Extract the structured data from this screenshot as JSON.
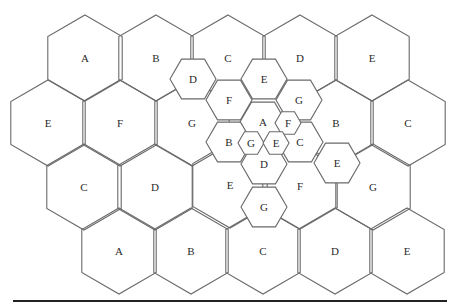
{
  "diagram": {
    "type": "hexagonal-cell-reuse",
    "colors": {
      "stroke": "#6a6a6a",
      "text": "#2a2a2a",
      "rule": "#222222",
      "background": "#ffffff"
    },
    "large_cells": [
      {
        "label": "A",
        "cx": 85,
        "cy": 58
      },
      {
        "label": "B",
        "cx": 156,
        "cy": 58
      },
      {
        "label": "C",
        "cx": 228,
        "cy": 58
      },
      {
        "label": "D",
        "cx": 300,
        "cy": 58
      },
      {
        "label": "E",
        "cx": 372,
        "cy": 58
      },
      {
        "label": "E",
        "cx": 48,
        "cy": 123
      },
      {
        "label": "F",
        "cx": 120,
        "cy": 123
      },
      {
        "label": "G",
        "cx": 192,
        "cy": 123
      },
      {
        "label": "B",
        "cx": 336,
        "cy": 123
      },
      {
        "label": "C",
        "cx": 408,
        "cy": 123
      },
      {
        "label": "C",
        "cx": 84,
        "cy": 187
      },
      {
        "label": "D",
        "cx": 155,
        "cy": 187
      },
      {
        "label": "E",
        "cx": 230,
        "cy": 185
      },
      {
        "label": "F",
        "cx": 300,
        "cy": 186
      },
      {
        "label": "G",
        "cx": 373,
        "cy": 187
      },
      {
        "label": "A",
        "cx": 119,
        "cy": 251
      },
      {
        "label": "B",
        "cx": 191,
        "cy": 251
      },
      {
        "label": "C",
        "cx": 263,
        "cy": 251
      },
      {
        "label": "D",
        "cx": 335,
        "cy": 251
      },
      {
        "label": "E",
        "cx": 407,
        "cy": 251
      }
    ],
    "medium_cells": [
      {
        "label": "D",
        "cx": 193,
        "cy": 79
      },
      {
        "label": "E",
        "cx": 264,
        "cy": 79
      },
      {
        "label": "F",
        "cx": 229,
        "cy": 100
      },
      {
        "label": "G",
        "cx": 299,
        "cy": 100
      },
      {
        "label": "A",
        "cx": 263,
        "cy": 122
      },
      {
        "label": "B",
        "cx": 229,
        "cy": 142
      },
      {
        "label": "C",
        "cx": 300,
        "cy": 142
      },
      {
        "label": "D",
        "cx": 264,
        "cy": 164
      },
      {
        "label": "E",
        "cx": 337,
        "cy": 163
      },
      {
        "label": "G",
        "cx": 264,
        "cy": 207
      }
    ],
    "small_cells": [
      {
        "label": "F",
        "cx": 288,
        "cy": 123
      },
      {
        "label": "G",
        "cx": 251,
        "cy": 143
      },
      {
        "label": "E",
        "cx": 276,
        "cy": 143
      }
    ]
  }
}
